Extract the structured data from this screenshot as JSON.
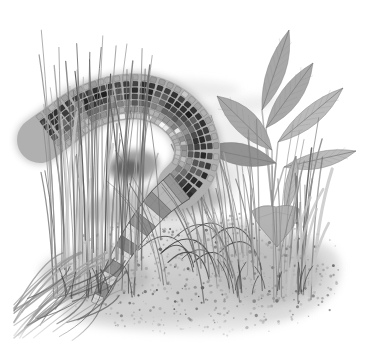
{
  "page": {
    "background": "#ffffff"
  },
  "illustration": {
    "subject": "alligator-lizard-in-grass",
    "description": "Grayscale naturalist illustration of an alligator lizard with a curled, square-scaled body and banded tapering tail, moving between tufts of tall grass beside a broad-leaved plant, on speckled stippled ground fading to white.",
    "style": "grayscale stipple-and-line scientific drawing",
    "seed": 7,
    "palette": {
      "background": "#ffffff",
      "wash": "#d9d9d9",
      "wash_light": "#e2e2e2",
      "ground_base": "#d2d2d2",
      "ground_shade": "#c0c0c0",
      "body_base": "#b0b0b0",
      "scale_edge": "#202020",
      "scale_rows": [
        "#a8a8a8",
        "#3a3a3a",
        "#2c2c2c",
        "#3f3f3f",
        "#666666",
        "#909090",
        "#bcbcbc"
      ],
      "tail_light": "#d9d9d9",
      "tail_dark": "#8a8a8a",
      "tail_edge": "#3f3f3f",
      "leaf_light": "#b7b7b7",
      "leaf_mid": "#a3a3a3",
      "leaf_dark": "#8d8d8d",
      "leaf_outline": "#7e7e7e",
      "vein": "#898989",
      "midrib": "#777777",
      "stem": "#9a9a9a",
      "shadow": "#6e6e6e",
      "hole_shadow": "#4f4f4f",
      "twig": "#3c3c3c",
      "grass_root": "#474747"
    },
    "lizard": {
      "spine": [
        [
          40,
          140
        ],
        [
          58,
          127
        ],
        [
          82,
          110
        ],
        [
          112,
          99
        ],
        [
          142,
          97
        ],
        [
          168,
          106
        ],
        [
          188,
          124
        ],
        [
          197,
          147
        ],
        [
          193,
          170
        ],
        [
          180,
          186
        ]
      ],
      "tail_spine": [
        [
          180,
          186
        ],
        [
          163,
          200
        ],
        [
          146,
          219
        ],
        [
          130,
          241
        ],
        [
          115,
          266
        ],
        [
          104,
          287
        ],
        [
          96,
          304
        ]
      ],
      "body_half_width": 23,
      "scale_step": 6.8,
      "row_spacing": 6.4,
      "tail_half_width_start": 16,
      "tail_half_width_end": 5,
      "tail_bands": 12,
      "loop_center": [
        138,
        150
      ]
    },
    "plant": {
      "stem_origin": [
        272,
        206
      ],
      "leaves": [
        {
          "base": [
            262,
            110
          ],
          "tip": [
            289,
            30
          ],
          "width": 20,
          "tone": "mid"
        },
        {
          "base": [
            266,
            128
          ],
          "tip": [
            313,
            63
          ],
          "width": 22,
          "tone": "mid"
        },
        {
          "base": [
            278,
            142
          ],
          "tip": [
            343,
            88
          ],
          "width": 20,
          "tone": "light"
        },
        {
          "base": [
            272,
            150
          ],
          "tip": [
            217,
            96
          ],
          "width": 26,
          "tone": "mid"
        },
        {
          "base": [
            276,
            163
          ],
          "tip": [
            204,
            148
          ],
          "width": 24,
          "tone": "dark"
        },
        {
          "base": [
            284,
            167
          ],
          "tip": [
            356,
            151
          ],
          "width": 18,
          "tone": "light"
        },
        {
          "base": [
            285,
            214
          ],
          "tip": [
            296,
            156
          ],
          "width": 13,
          "tone": "light"
        }
      ],
      "droop_leaf": {
        "left": [
          252,
          211
        ],
        "right": [
          299,
          209
        ],
        "tip": [
          277,
          247
        ]
      }
    },
    "grass": {
      "left_tuft": {
        "x": [
          52,
          140
        ],
        "y": [
          248,
          298
        ],
        "count": 58
      },
      "left_droop": {
        "count": 26
      },
      "overlay_blades": {
        "count": 10
      },
      "mid_overlay": {
        "count": 6
      },
      "right_tuft": {
        "x": [
          196,
          315
        ],
        "y": [
          252,
          303
        ],
        "count": 52
      }
    },
    "ground": {
      "center": [
        205,
        274
      ],
      "rx": 145,
      "ry": 62,
      "stipple_attempts": 700,
      "speck_attempts": 90,
      "twig_count": 10
    }
  }
}
